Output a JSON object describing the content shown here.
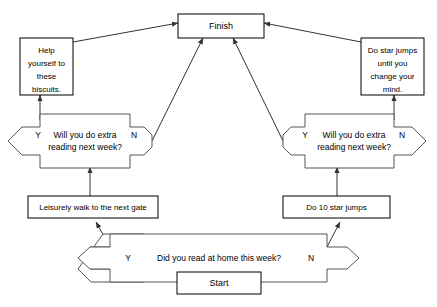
{
  "diagram": {
    "colors": {
      "background": "#ffffff",
      "node_stroke": "#000000",
      "decision_stroke": "#555555",
      "connector_stroke": "#333333",
      "text": "#000000"
    },
    "nodes": {
      "start": {
        "label": "Start",
        "type": "terminator"
      },
      "finish": {
        "label": "Finish",
        "type": "terminator"
      },
      "biscuits": {
        "type": "process",
        "lines": [
          "Help",
          "yourself to",
          "these",
          "biscuits."
        ]
      },
      "star_jumps_forever": {
        "type": "process",
        "lines": [
          "Do star jumps",
          "until you",
          "change your",
          "mind."
        ]
      },
      "leisurely_walk": {
        "type": "process",
        "lines": [
          "Leisurely walk to the next gate"
        ]
      },
      "ten_star_jumps": {
        "type": "process",
        "lines": [
          "Do 10 star jumps"
        ]
      }
    },
    "decisions": {
      "read_at_home": {
        "type": "decision",
        "lines": [
          "Did you read at home this week?"
        ],
        "yes_label": "Y",
        "no_label": "N"
      },
      "extra_reading_left": {
        "type": "decision",
        "lines": [
          "Will you do extra",
          "reading next week?"
        ],
        "yes_label": "Y",
        "no_label": "N"
      },
      "extra_reading_right": {
        "type": "decision",
        "lines": [
          "Will you do extra",
          "reading next week?"
        ],
        "yes_label": "Y",
        "no_label": "N"
      }
    }
  }
}
